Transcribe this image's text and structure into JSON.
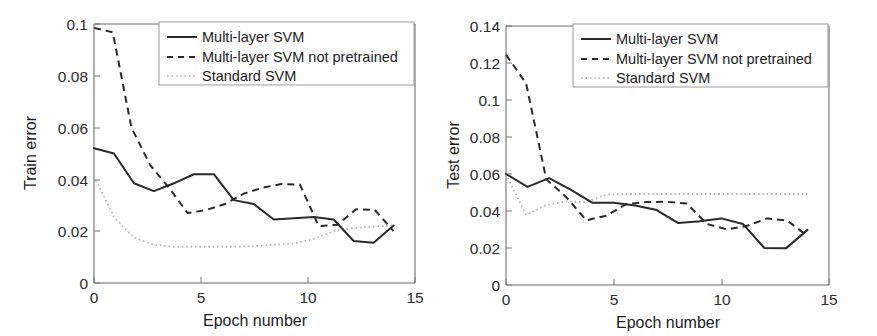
{
  "figure": {
    "background": "#ffffff",
    "panel_count": 2
  },
  "colors": {
    "solid": "#2a2a2a",
    "dashed": "#2a2a2a",
    "dotted": "#b3b3b3",
    "axis": "#6d6d6d",
    "text": "#1c1c1c"
  },
  "chart_data": [
    {
      "id": "train-error",
      "type": "line",
      "title": "",
      "xlabel": "Epoch number",
      "ylabel": "Train error",
      "xlim": [
        0,
        15
      ],
      "ylim": [
        0,
        0.1
      ],
      "xticks": [
        0,
        5,
        10,
        15
      ],
      "xtick_labels": [
        "0",
        "5",
        "10",
        "15"
      ],
      "yticks": [
        0,
        0.02,
        0.04,
        0.06,
        0.08,
        0.1
      ],
      "ytick_labels": [
        "0",
        "0.02",
        "0.04",
        "0.06",
        "0.08",
        "0.1"
      ],
      "grid": false,
      "legend_position": "top-right",
      "x": [
        0,
        1,
        2,
        3,
        4,
        5,
        6,
        7,
        8,
        9,
        10,
        11,
        12,
        13,
        14
      ],
      "series": [
        {
          "name": "Multi-layer SVM",
          "style": "solid",
          "values": [
            0.052,
            0.05,
            0.0385,
            0.0355,
            0.0385,
            0.042,
            0.042,
            0.032,
            0.0305,
            0.0245,
            0.025,
            0.0255,
            0.0245,
            0.0162,
            0.0155,
            0.0222
          ]
        },
        {
          "name": "Multi-layer SVM not pretrained",
          "style": "dashed",
          "values": [
            0.0985,
            0.0968,
            0.06,
            0.0455,
            0.0368,
            0.027,
            0.0282,
            0.0305,
            0.0345,
            0.0368,
            0.0382,
            0.038,
            0.022,
            0.0225,
            0.0285,
            0.0282,
            0.02
          ]
        },
        {
          "name": "Standard SVM",
          "style": "dotted",
          "values": [
            0.0412,
            0.0255,
            0.0175,
            0.0148,
            0.014,
            0.014,
            0.014,
            0.014,
            0.0142,
            0.0148,
            0.0152,
            0.017,
            0.02,
            0.0212,
            0.0218,
            0.0222
          ]
        }
      ]
    },
    {
      "id": "test-error",
      "type": "line",
      "title": "",
      "xlabel": "Epoch number",
      "ylabel": "Test error",
      "xlim": [
        0,
        15
      ],
      "ylim": [
        0,
        0.14
      ],
      "xticks": [
        0,
        5,
        10,
        15
      ],
      "xtick_labels": [
        "0",
        "5",
        "10",
        "15"
      ],
      "yticks": [
        0,
        0.02,
        0.04,
        0.06,
        0.08,
        0.1,
        0.12,
        0.14
      ],
      "ytick_labels": [
        "0",
        "0.02",
        "0.04",
        "0.06",
        "0.08",
        "0.1",
        "0.12",
        "0.14"
      ],
      "grid": false,
      "legend_position": "top-right",
      "x": [
        0,
        1,
        2,
        3,
        4,
        5,
        6,
        7,
        8,
        9,
        10,
        11,
        12,
        13,
        14
      ],
      "series": [
        {
          "name": "Multi-layer SVM",
          "style": "solid",
          "values": [
            0.06,
            0.053,
            0.0578,
            0.0515,
            0.0445,
            0.0445,
            0.043,
            0.0405,
            0.0335,
            0.0345,
            0.036,
            0.033,
            0.02,
            0.0198,
            0.0298
          ]
        },
        {
          "name": "Multi-layer SVM not pretrained",
          "style": "dashed",
          "values": [
            0.1245,
            0.109,
            0.0572,
            0.0475,
            0.035,
            0.0375,
            0.0438,
            0.0448,
            0.045,
            0.044,
            0.033,
            0.03,
            0.032,
            0.036,
            0.0348,
            0.0265
          ]
        },
        {
          "name": "Standard SVM",
          "style": "dotted",
          "values": [
            0.06,
            0.0378,
            0.0432,
            0.0452,
            0.0448,
            0.049,
            0.0492,
            0.0492,
            0.0492,
            0.0492,
            0.0492,
            0.0492,
            0.0492,
            0.0492,
            0.0492,
            0.0492
          ]
        }
      ]
    }
  ],
  "panels": {
    "train": {
      "ylabel": "Train error",
      "xlabel": "Epoch number",
      "ytick_labels": [
        "0.1",
        "0.08",
        "0.06",
        "0.04",
        "0.02",
        "0"
      ],
      "xtick_labels": [
        "0",
        "5",
        "10",
        "15"
      ],
      "legend": [
        {
          "label": "Multi-layer SVM",
          "style": "solid"
        },
        {
          "label": "Multi-layer SVM not pretrained",
          "style": "dashed"
        },
        {
          "label": "Standard SVM",
          "style": "dotted"
        }
      ]
    },
    "test": {
      "ylabel": "Test error",
      "xlabel": "Epoch number",
      "ytick_labels": [
        "0.14",
        "0.12",
        "0.1",
        "0.08",
        "0.06",
        "0.04",
        "0.02",
        "0"
      ],
      "xtick_labels": [
        "0",
        "5",
        "10",
        "15"
      ],
      "legend": [
        {
          "label": "Multi-layer SVM",
          "style": "solid"
        },
        {
          "label": "Multi-layer SVM not pretrained",
          "style": "dashed"
        },
        {
          "label": "Standard SVM",
          "style": "dotted"
        }
      ]
    }
  }
}
